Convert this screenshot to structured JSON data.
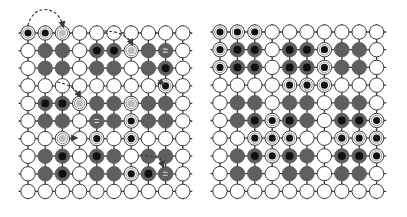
{
  "diagram": {
    "colors": {
      "background": "#ffffff",
      "grid_line": "#3a3a3a",
      "node_stroke": "#3a3a3a",
      "white_node": "#ffffff",
      "grey_node": "#5f5f5f",
      "dark_center": "#111111",
      "ring_fill": "#ffffff",
      "light_center": "#bdbdbd",
      "arrow": "#3a3a3a"
    },
    "legend_codes": {
      "w": "empty white node",
      "g": "grey node",
      "d": "grey node with dark center",
      "r": "ringed node with black center",
      "l": "ringed node with light center (target)",
      "m": "grey node with marker"
    },
    "grids": [
      {
        "name": "left-grid",
        "origin_x": 28,
        "origin_y": 33,
        "spacing_x": 17.2,
        "spacing_y": 17.6,
        "rows": [
          [
            "r",
            "r",
            "l",
            "w",
            "w",
            "w",
            "w",
            "w",
            "w",
            "w"
          ],
          [
            "w",
            "g",
            "g",
            "w",
            "d",
            "d",
            "l",
            "g",
            "m",
            "w"
          ],
          [
            "w",
            "g",
            "g",
            "w",
            "g",
            "g",
            "w",
            "g",
            "d",
            "w"
          ],
          [
            "w",
            "w",
            "w",
            "w",
            "w",
            "w",
            "w",
            "w",
            "r",
            "w"
          ],
          [
            "w",
            "d",
            "d",
            "l",
            "g",
            "g",
            "l",
            "g",
            "g",
            "w"
          ],
          [
            "w",
            "g",
            "g",
            "w",
            "m",
            "g",
            "r",
            "g",
            "g",
            "w"
          ],
          [
            "w",
            "w",
            "l",
            "w",
            "r",
            "w",
            "r",
            "w",
            "w",
            "w"
          ],
          [
            "w",
            "g",
            "d",
            "w",
            "d",
            "g",
            "w",
            "g",
            "g",
            "w"
          ],
          [
            "w",
            "g",
            "d",
            "w",
            "g",
            "g",
            "r",
            "d",
            "m",
            "w"
          ],
          [
            "w",
            "w",
            "w",
            "w",
            "w",
            "w",
            "w",
            "w",
            "w",
            "w"
          ]
        ],
        "arrows": [
          {
            "name": "arc-arrow-row0",
            "path": "M28,26 C32,4 58,4 63,26"
          },
          {
            "name": "dash-arrow-row1",
            "path": "M104,31 C118,31 128,36 132,44"
          },
          {
            "name": "dash-arrow-row4",
            "path": "M57,82 C70,84 76,90 80,96"
          },
          {
            "name": "dash-arrow-row3-col8",
            "path": "M158,80 L163,84"
          },
          {
            "name": "dash-arrow-row6",
            "path": "M69,138 L76,138"
          },
          {
            "name": "dash-arrow-row7",
            "path": "M140,155 L160,158 L163,166"
          }
        ]
      },
      {
        "name": "right-grid",
        "origin_x": 220,
        "origin_y": 32,
        "spacing_x": 17.4,
        "spacing_y": 17.7,
        "rows": [
          [
            "r",
            "r",
            "r",
            "w",
            "w",
            "w",
            "w",
            "w",
            "w",
            "w"
          ],
          [
            "r",
            "d",
            "d",
            "w",
            "d",
            "d",
            "r",
            "g",
            "g",
            "w"
          ],
          [
            "r",
            "d",
            "d",
            "w",
            "d",
            "d",
            "r",
            "g",
            "g",
            "w"
          ],
          [
            "w",
            "w",
            "w",
            "w",
            "r",
            "r",
            "r",
            "w",
            "w",
            "w"
          ],
          [
            "w",
            "g",
            "g",
            "w",
            "g",
            "g",
            "w",
            "g",
            "g",
            "w"
          ],
          [
            "w",
            "g",
            "d",
            "r",
            "d",
            "g",
            "w",
            "d",
            "d",
            "r"
          ],
          [
            "w",
            "w",
            "r",
            "r",
            "r",
            "w",
            "w",
            "r",
            "r",
            "r"
          ],
          [
            "w",
            "g",
            "d",
            "r",
            "d",
            "g",
            "w",
            "d",
            "d",
            "r"
          ],
          [
            "w",
            "g",
            "g",
            "w",
            "g",
            "g",
            "w",
            "g",
            "g",
            "w"
          ],
          [
            "w",
            "w",
            "w",
            "w",
            "w",
            "w",
            "w",
            "w",
            "w",
            "w"
          ]
        ],
        "arrows": []
      }
    ]
  }
}
